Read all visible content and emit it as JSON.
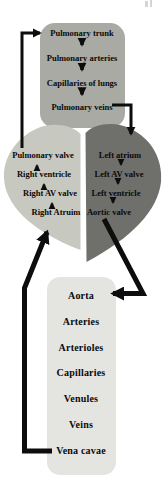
{
  "colors": {
    "line": "#0d0d0d",
    "lungs_box_fill": "#a8aaa3",
    "right_heart_fill": "#c7c9c1",
    "left_heart_fill": "#6f6f6b",
    "systemic_box_fill": "#e4e4e0",
    "artifact_fill": "#d4d4d4",
    "text": "#0a0a0a"
  },
  "pulmonary_circuit_box": {
    "items": [
      "Pulmonary trunk",
      "Pulmonary arteries",
      "Capillaries of lungs",
      "Pulmonary veins"
    ]
  },
  "heart": {
    "right_heart_labels": [
      "Pulmonary valve",
      "Right ventricle",
      "Right AV valve",
      "Right Atruim"
    ],
    "left_heart_labels": [
      "Left atrium",
      "Left AV valve",
      "Left ventricle",
      "Aortic valve"
    ]
  },
  "systemic_circuit_box": {
    "items": [
      "Aorta",
      "Arteries",
      "Arterioles",
      "Capillaries",
      "Venules",
      "Veins",
      "Vena cavae"
    ]
  }
}
